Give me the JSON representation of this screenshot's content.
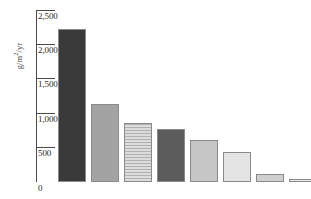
{
  "chart_data": {
    "type": "bar",
    "title": "",
    "xlabel": "",
    "ylabel": "g/m²/yr",
    "ylabel_parts": {
      "pre": "g/m",
      "sup": "2",
      "post": "/yr"
    },
    "ylim": [
      0,
      2500
    ],
    "yticks": [
      2500,
      2000,
      1500,
      1000,
      500,
      0
    ],
    "ytick_labels": [
      "2,500",
      "2,000",
      "1,500",
      "1,000",
      "500",
      "0"
    ],
    "grid": false,
    "legend": "none",
    "categories": [
      "1",
      "2",
      "3",
      "4",
      "5",
      "6",
      "7",
      "8"
    ],
    "values": [
      2220,
      1140,
      860,
      770,
      610,
      430,
      120,
      30
    ],
    "bars": [
      {
        "label": "1",
        "value": 2220,
        "color": "#3a3a3a",
        "pattern": "solid"
      },
      {
        "label": "2",
        "value": 1140,
        "color": "#a3a3a3",
        "pattern": "solid"
      },
      {
        "label": "3",
        "value": 860,
        "color": "#dcdcdc",
        "pattern": "horizontal-hatch"
      },
      {
        "label": "4",
        "value": 770,
        "color": "#5c5c5c",
        "pattern": "solid"
      },
      {
        "label": "5",
        "value": 610,
        "color": "#c6c6c6",
        "pattern": "solid"
      },
      {
        "label": "6",
        "value": 430,
        "color": "#e4e4e4",
        "pattern": "solid"
      },
      {
        "label": "7",
        "value": 120,
        "color": "#cfcfcf",
        "pattern": "solid"
      },
      {
        "label": "8",
        "value": 30,
        "color": "#e8e8e8",
        "pattern": "solid"
      }
    ],
    "colors": {
      "axis": "#4a4a4a",
      "tick_text": "#2b2b2b",
      "bar_border": "#8a8a8a",
      "background": "#ffffff"
    }
  }
}
